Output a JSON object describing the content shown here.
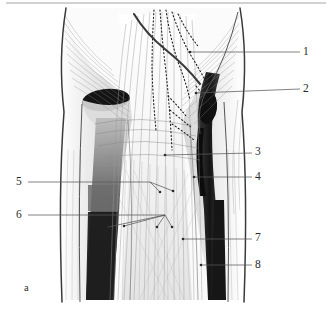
{
  "figure": {
    "panel_label": "a",
    "caption_title": "",
    "type": "anatomical-illustration",
    "background_color": "#ffffff",
    "ink_color": "#2b2b2b",
    "muscle_light": "#f2f2f2",
    "muscle_mid": "#cfcfcf",
    "muscle_dark": "#6e6e6e",
    "tendon_black": "#1a1a1a"
  },
  "labels": [
    {
      "id": "1",
      "text": "1",
      "x": 308,
      "y": 52,
      "leader_from_x": 190,
      "leader_from_y": 52,
      "side": "right"
    },
    {
      "id": "2",
      "text": "2",
      "x": 308,
      "y": 90,
      "leader_from_x": 196,
      "leader_from_y": 93,
      "side": "right"
    },
    {
      "id": "3",
      "text": "3",
      "x": 258,
      "y": 152,
      "leader_from_x": 165,
      "leader_from_y": 155,
      "side": "right"
    },
    {
      "id": "4",
      "text": "4",
      "x": 258,
      "y": 177,
      "leader_from_x": 194,
      "leader_from_y": 177,
      "side": "right"
    },
    {
      "id": "5",
      "text": "5",
      "x": 18,
      "y": 182,
      "leader_from_x": 150,
      "leader_from_y": 182,
      "side": "left"
    },
    {
      "id": "6",
      "text": "6",
      "x": 18,
      "y": 215,
      "leader_from_x": 165,
      "leader_from_y": 215,
      "side": "left"
    },
    {
      "id": "7",
      "text": "7",
      "x": 258,
      "y": 238,
      "leader_from_x": 183,
      "leader_from_y": 239,
      "side": "right"
    },
    {
      "id": "8",
      "text": "8",
      "x": 258,
      "y": 265,
      "leader_from_x": 201,
      "leader_from_y": 265,
      "side": "right"
    }
  ],
  "leader_dots": {
    "group_5": [
      {
        "x": 160,
        "y": 192
      },
      {
        "x": 173,
        "y": 191
      }
    ],
    "group_6": [
      {
        "x": 108,
        "y": 227
      },
      {
        "x": 124,
        "y": 226
      },
      {
        "x": 157,
        "y": 227
      },
      {
        "x": 172,
        "y": 227
      }
    ]
  },
  "top_rule": {
    "y": 3,
    "x1": 6,
    "x2": 326,
    "color": "#9a9a9a"
  },
  "drawing_bounds": {
    "x1": 30,
    "y1": 8,
    "x2": 248,
    "y2": 302
  }
}
